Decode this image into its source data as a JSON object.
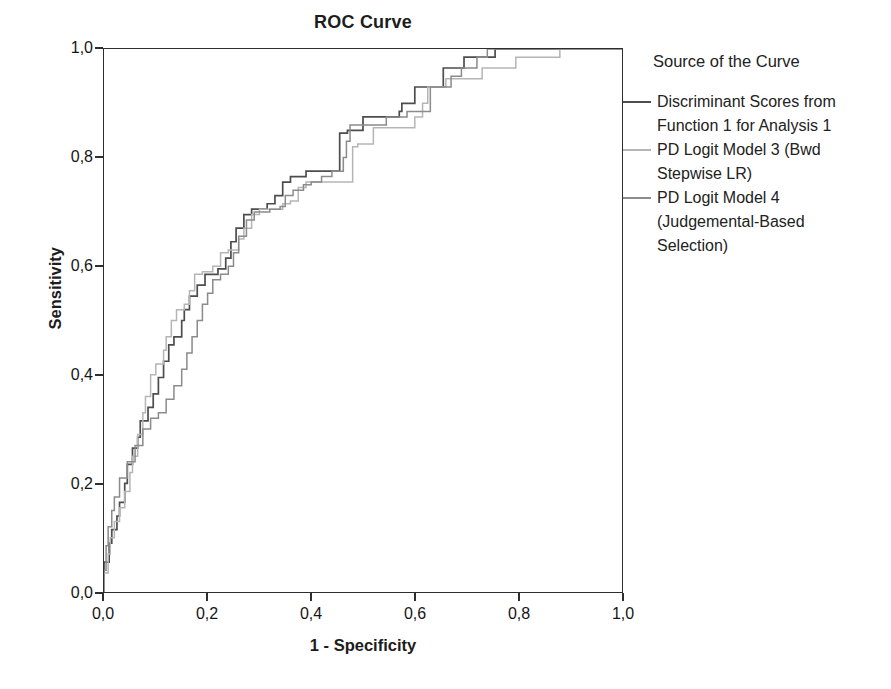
{
  "page": {
    "background": "#ffffff"
  },
  "chart_data": {
    "type": "line",
    "subtype": "roc-step-curves",
    "title": "ROC Curve",
    "xlabel": "1 - Specificity",
    "ylabel": "Sensitivity",
    "xlim": [
      0,
      1
    ],
    "ylim": [
      0,
      1
    ],
    "grid": false,
    "decimal_separator": ",",
    "x_ticks": [
      {
        "v": 0.0,
        "label": "0,0"
      },
      {
        "v": 0.2,
        "label": "0,2"
      },
      {
        "v": 0.4,
        "label": "0,4"
      },
      {
        "v": 0.6,
        "label": "0,6"
      },
      {
        "v": 0.8,
        "label": "0,8"
      },
      {
        "v": 1.0,
        "label": "1,0"
      }
    ],
    "y_ticks": [
      {
        "v": 0.0,
        "label": "0,0"
      },
      {
        "v": 0.2,
        "label": "0,2"
      },
      {
        "v": 0.4,
        "label": "0,4"
      },
      {
        "v": 0.6,
        "label": "0,6"
      },
      {
        "v": 0.8,
        "label": "0,8"
      },
      {
        "v": 1.0,
        "label": "1,0"
      }
    ],
    "legend": {
      "title": "Source of the Curve",
      "position": "right",
      "items": [
        {
          "lines": [
            "Discriminant Scores from",
            "Function 1 for Analysis 1"
          ],
          "color": "#4d4d4d"
        },
        {
          "lines": [
            "PD Logit Model 3 (Bwd",
            "Stepwise LR)"
          ],
          "color": "#b5b5b5"
        },
        {
          "lines": [
            "PD Logit Model 4",
            "(Judgemental-Based",
            "Selection)"
          ],
          "color": "#8b8b8b"
        }
      ]
    },
    "series": [
      {
        "name": "Discriminant Scores from Function 1 for Analysis 1",
        "color": "#4d4d4d",
        "stroke_width": 1.7,
        "points": [
          [
            0,
            0
          ],
          [
            0,
            0.055
          ],
          [
            0.01,
            0.055
          ],
          [
            0.01,
            0.09
          ],
          [
            0.015,
            0.09
          ],
          [
            0.015,
            0.115
          ],
          [
            0.025,
            0.115
          ],
          [
            0.025,
            0.14
          ],
          [
            0.03,
            0.14
          ],
          [
            0.03,
            0.165
          ],
          [
            0.04,
            0.165
          ],
          [
            0.04,
            0.2
          ],
          [
            0.045,
            0.2
          ],
          [
            0.045,
            0.235
          ],
          [
            0.055,
            0.235
          ],
          [
            0.055,
            0.265
          ],
          [
            0.065,
            0.265
          ],
          [
            0.065,
            0.285
          ],
          [
            0.07,
            0.285
          ],
          [
            0.07,
            0.315
          ],
          [
            0.085,
            0.315
          ],
          [
            0.085,
            0.34
          ],
          [
            0.095,
            0.34
          ],
          [
            0.095,
            0.365
          ],
          [
            0.105,
            0.365
          ],
          [
            0.105,
            0.395
          ],
          [
            0.115,
            0.395
          ],
          [
            0.115,
            0.425
          ],
          [
            0.125,
            0.425
          ],
          [
            0.125,
            0.455
          ],
          [
            0.135,
            0.455
          ],
          [
            0.135,
            0.47
          ],
          [
            0.15,
            0.47
          ],
          [
            0.15,
            0.5
          ],
          [
            0.155,
            0.5
          ],
          [
            0.155,
            0.52
          ],
          [
            0.165,
            0.52
          ],
          [
            0.165,
            0.545
          ],
          [
            0.18,
            0.545
          ],
          [
            0.18,
            0.565
          ],
          [
            0.195,
            0.565
          ],
          [
            0.195,
            0.585
          ],
          [
            0.22,
            0.585
          ],
          [
            0.22,
            0.595
          ],
          [
            0.235,
            0.595
          ],
          [
            0.235,
            0.615
          ],
          [
            0.245,
            0.615
          ],
          [
            0.245,
            0.645
          ],
          [
            0.255,
            0.645
          ],
          [
            0.255,
            0.67
          ],
          [
            0.27,
            0.67
          ],
          [
            0.27,
            0.695
          ],
          [
            0.285,
            0.695
          ],
          [
            0.285,
            0.705
          ],
          [
            0.315,
            0.705
          ],
          [
            0.315,
            0.715
          ],
          [
            0.33,
            0.715
          ],
          [
            0.33,
            0.73
          ],
          [
            0.345,
            0.73
          ],
          [
            0.345,
            0.755
          ],
          [
            0.36,
            0.755
          ],
          [
            0.36,
            0.765
          ],
          [
            0.39,
            0.765
          ],
          [
            0.39,
            0.775
          ],
          [
            0.455,
            0.775
          ],
          [
            0.455,
            0.845
          ],
          [
            0.47,
            0.845
          ],
          [
            0.47,
            0.85
          ],
          [
            0.5,
            0.85
          ],
          [
            0.5,
            0.875
          ],
          [
            0.57,
            0.875
          ],
          [
            0.57,
            0.885
          ],
          [
            0.575,
            0.885
          ],
          [
            0.575,
            0.9
          ],
          [
            0.6,
            0.9
          ],
          [
            0.6,
            0.93
          ],
          [
            0.655,
            0.93
          ],
          [
            0.655,
            0.965
          ],
          [
            0.695,
            0.965
          ],
          [
            0.695,
            0.985
          ],
          [
            0.755,
            0.985
          ],
          [
            0.755,
            1
          ],
          [
            1,
            1
          ]
        ]
      },
      {
        "name": "PD Logit Model 3 (Bwd Stepwise LR)",
        "color": "#b5b5b5",
        "stroke_width": 1.5,
        "points": [
          [
            0,
            0
          ],
          [
            0,
            0.035
          ],
          [
            0.008,
            0.035
          ],
          [
            0.008,
            0.07
          ],
          [
            0.012,
            0.07
          ],
          [
            0.012,
            0.1
          ],
          [
            0.02,
            0.1
          ],
          [
            0.02,
            0.13
          ],
          [
            0.03,
            0.13
          ],
          [
            0.03,
            0.155
          ],
          [
            0.04,
            0.155
          ],
          [
            0.04,
            0.185
          ],
          [
            0.05,
            0.185
          ],
          [
            0.05,
            0.22
          ],
          [
            0.055,
            0.22
          ],
          [
            0.055,
            0.25
          ],
          [
            0.065,
            0.25
          ],
          [
            0.065,
            0.29
          ],
          [
            0.075,
            0.29
          ],
          [
            0.075,
            0.33
          ],
          [
            0.08,
            0.33
          ],
          [
            0.08,
            0.36
          ],
          [
            0.09,
            0.36
          ],
          [
            0.09,
            0.4
          ],
          [
            0.1,
            0.4
          ],
          [
            0.1,
            0.42
          ],
          [
            0.115,
            0.42
          ],
          [
            0.115,
            0.445
          ],
          [
            0.12,
            0.445
          ],
          [
            0.12,
            0.47
          ],
          [
            0.13,
            0.47
          ],
          [
            0.13,
            0.5
          ],
          [
            0.14,
            0.5
          ],
          [
            0.14,
            0.52
          ],
          [
            0.155,
            0.52
          ],
          [
            0.155,
            0.53
          ],
          [
            0.165,
            0.53
          ],
          [
            0.165,
            0.555
          ],
          [
            0.175,
            0.555
          ],
          [
            0.175,
            0.585
          ],
          [
            0.19,
            0.585
          ],
          [
            0.19,
            0.59
          ],
          [
            0.21,
            0.59
          ],
          [
            0.21,
            0.6
          ],
          [
            0.225,
            0.6
          ],
          [
            0.225,
            0.625
          ],
          [
            0.24,
            0.625
          ],
          [
            0.24,
            0.63
          ],
          [
            0.26,
            0.63
          ],
          [
            0.26,
            0.65
          ],
          [
            0.27,
            0.65
          ],
          [
            0.27,
            0.67
          ],
          [
            0.285,
            0.67
          ],
          [
            0.285,
            0.695
          ],
          [
            0.3,
            0.695
          ],
          [
            0.3,
            0.705
          ],
          [
            0.345,
            0.705
          ],
          [
            0.345,
            0.715
          ],
          [
            0.36,
            0.715
          ],
          [
            0.36,
            0.72
          ],
          [
            0.375,
            0.72
          ],
          [
            0.375,
            0.745
          ],
          [
            0.39,
            0.745
          ],
          [
            0.39,
            0.755
          ],
          [
            0.48,
            0.755
          ],
          [
            0.48,
            0.82
          ],
          [
            0.49,
            0.82
          ],
          [
            0.49,
            0.825
          ],
          [
            0.52,
            0.825
          ],
          [
            0.52,
            0.855
          ],
          [
            0.6,
            0.855
          ],
          [
            0.6,
            0.875
          ],
          [
            0.615,
            0.875
          ],
          [
            0.615,
            0.9
          ],
          [
            0.625,
            0.9
          ],
          [
            0.625,
            0.93
          ],
          [
            0.66,
            0.93
          ],
          [
            0.66,
            0.945
          ],
          [
            0.73,
            0.945
          ],
          [
            0.73,
            0.965
          ],
          [
            0.795,
            0.965
          ],
          [
            0.795,
            0.985
          ],
          [
            0.88,
            0.985
          ],
          [
            0.88,
            1
          ],
          [
            1,
            1
          ]
        ]
      },
      {
        "name": "PD Logit Model 4 (Judgemental-Based Selection)",
        "color": "#8b8b8b",
        "stroke_width": 1.5,
        "points": [
          [
            0,
            0
          ],
          [
            0,
            0.04
          ],
          [
            0.004,
            0.04
          ],
          [
            0.004,
            0.085
          ],
          [
            0.008,
            0.085
          ],
          [
            0.008,
            0.12
          ],
          [
            0.015,
            0.12
          ],
          [
            0.015,
            0.15
          ],
          [
            0.02,
            0.15
          ],
          [
            0.02,
            0.175
          ],
          [
            0.03,
            0.175
          ],
          [
            0.03,
            0.21
          ],
          [
            0.045,
            0.21
          ],
          [
            0.045,
            0.24
          ],
          [
            0.06,
            0.24
          ],
          [
            0.06,
            0.27
          ],
          [
            0.075,
            0.27
          ],
          [
            0.075,
            0.3
          ],
          [
            0.09,
            0.3
          ],
          [
            0.09,
            0.32
          ],
          [
            0.105,
            0.32
          ],
          [
            0.105,
            0.33
          ],
          [
            0.12,
            0.33
          ],
          [
            0.12,
            0.355
          ],
          [
            0.135,
            0.355
          ],
          [
            0.135,
            0.38
          ],
          [
            0.15,
            0.38
          ],
          [
            0.15,
            0.41
          ],
          [
            0.16,
            0.41
          ],
          [
            0.16,
            0.44
          ],
          [
            0.17,
            0.44
          ],
          [
            0.17,
            0.47
          ],
          [
            0.18,
            0.47
          ],
          [
            0.18,
            0.5
          ],
          [
            0.19,
            0.5
          ],
          [
            0.19,
            0.53
          ],
          [
            0.2,
            0.53
          ],
          [
            0.2,
            0.55
          ],
          [
            0.21,
            0.55
          ],
          [
            0.21,
            0.575
          ],
          [
            0.225,
            0.575
          ],
          [
            0.225,
            0.585
          ],
          [
            0.24,
            0.585
          ],
          [
            0.24,
            0.6
          ],
          [
            0.25,
            0.6
          ],
          [
            0.25,
            0.625
          ],
          [
            0.26,
            0.625
          ],
          [
            0.26,
            0.655
          ],
          [
            0.275,
            0.655
          ],
          [
            0.275,
            0.685
          ],
          [
            0.29,
            0.685
          ],
          [
            0.29,
            0.7
          ],
          [
            0.32,
            0.7
          ],
          [
            0.32,
            0.705
          ],
          [
            0.34,
            0.705
          ],
          [
            0.34,
            0.71
          ],
          [
            0.35,
            0.71
          ],
          [
            0.35,
            0.73
          ],
          [
            0.365,
            0.73
          ],
          [
            0.365,
            0.74
          ],
          [
            0.385,
            0.74
          ],
          [
            0.385,
            0.75
          ],
          [
            0.4,
            0.75
          ],
          [
            0.4,
            0.755
          ],
          [
            0.42,
            0.755
          ],
          [
            0.42,
            0.765
          ],
          [
            0.44,
            0.765
          ],
          [
            0.44,
            0.775
          ],
          [
            0.462,
            0.775
          ],
          [
            0.462,
            0.8
          ],
          [
            0.468,
            0.8
          ],
          [
            0.468,
            0.83
          ],
          [
            0.475,
            0.83
          ],
          [
            0.475,
            0.86
          ],
          [
            0.545,
            0.86
          ],
          [
            0.545,
            0.875
          ],
          [
            0.585,
            0.875
          ],
          [
            0.585,
            0.885
          ],
          [
            0.63,
            0.885
          ],
          [
            0.63,
            0.93
          ],
          [
            0.67,
            0.93
          ],
          [
            0.67,
            0.95
          ],
          [
            0.69,
            0.95
          ],
          [
            0.69,
            0.965
          ],
          [
            0.72,
            0.965
          ],
          [
            0.72,
            0.985
          ],
          [
            0.74,
            0.985
          ],
          [
            0.74,
            1
          ],
          [
            1,
            1
          ]
        ]
      }
    ],
    "axis_color": "#2e2e2e"
  },
  "layout_hints": {
    "plot_left_px": 103,
    "plot_top_px": 48,
    "plot_width_px": 520,
    "plot_height_px": 545
  }
}
